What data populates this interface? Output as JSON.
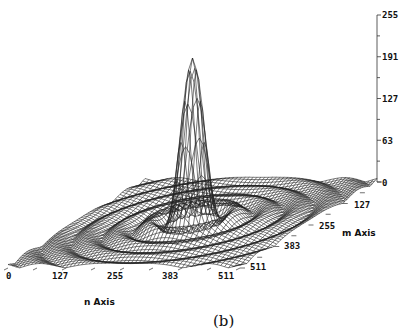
{
  "chart_data": {
    "type": "surface3d",
    "title": "",
    "caption": "(b)",
    "xlabel": "n Axis",
    "ylabel": "m Axis",
    "zlabel": "",
    "x_ticks": [
      "0",
      "127",
      "255",
      "383",
      "511"
    ],
    "y_ticks": [
      "0",
      "127",
      "255",
      "383",
      "511"
    ],
    "z_ticks": [
      "255",
      "191",
      "127",
      "63",
      "0"
    ],
    "xlim": [
      0,
      511
    ],
    "ylim": [
      0,
      511
    ],
    "zlim": [
      0,
      255
    ],
    "peak": {
      "n": 255,
      "m": 255,
      "value": 255
    },
    "grid": false,
    "legend": null
  },
  "labels": {
    "z_ticks": [
      "255",
      "191",
      "127",
      "63",
      "0"
    ],
    "n_ticks": [
      "0",
      "127",
      "255",
      "383",
      "511"
    ],
    "m_ticks": [
      "127",
      "255",
      "383",
      "511"
    ],
    "n_axis_title": "n Axis",
    "m_axis_title": "m Axis",
    "caption": "(b)"
  }
}
